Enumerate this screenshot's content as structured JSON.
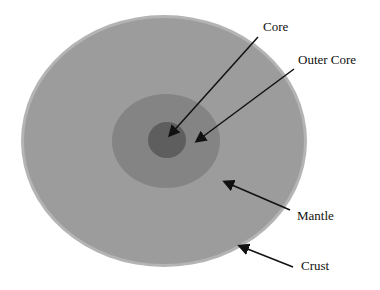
{
  "diagram": {
    "layers": [
      {
        "name": "core",
        "label": "Core",
        "color": "#5e5e5e"
      },
      {
        "name": "outer-core",
        "label": "Outer Core",
        "color": "#848484"
      },
      {
        "name": "mantle",
        "label": "Mantle",
        "color": "#9c9c9c"
      },
      {
        "name": "crust",
        "label": "Crust",
        "color": "#b4b4b4"
      }
    ]
  }
}
